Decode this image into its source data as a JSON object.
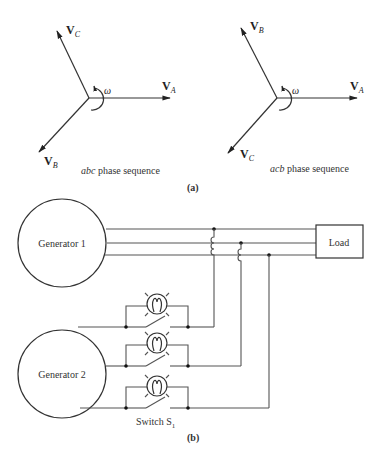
{
  "part_a": {
    "label": "(a)",
    "left_phasor": {
      "vectors": [
        {
          "name": "V",
          "subscript": "A"
        },
        {
          "name": "V",
          "subscript": "B"
        },
        {
          "name": "V",
          "subscript": "C"
        }
      ],
      "rotation_symbol": "ω",
      "caption_italic": "abc",
      "caption_rest": " phase sequence"
    },
    "right_phasor": {
      "vectors": [
        {
          "name": "V",
          "subscript": "A"
        },
        {
          "name": "V",
          "subscript": "B"
        },
        {
          "name": "V",
          "subscript": "C"
        }
      ],
      "rotation_symbol": "ω",
      "caption_italic": "acb",
      "caption_rest": " phase sequence"
    }
  },
  "part_b": {
    "label": "(b)",
    "generator1": "Generator 1",
    "generator2": "Generator 2",
    "load": "Load",
    "switch_label": "Switch S",
    "switch_subscript": "1"
  }
}
